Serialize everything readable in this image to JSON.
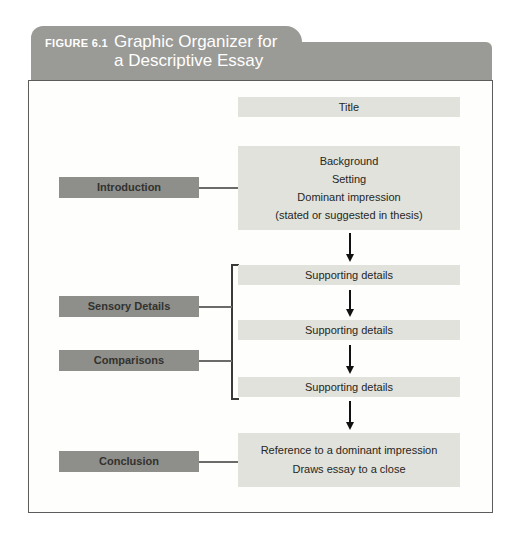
{
  "figure_header": {
    "label": "FIGURE 6.1",
    "title_line1": "Graphic Organizer for",
    "title_line2": "a Descriptive Essay"
  },
  "diagram": {
    "title_box": {
      "text": "Title"
    },
    "introduction": {
      "label": "Introduction",
      "box_lines": [
        "Background",
        "Setting",
        "Dominant impression",
        "(stated or suggested in thesis)"
      ]
    },
    "middle": {
      "label_sensory": "Sensory Details",
      "label_comparisons": "Comparisons",
      "supporting_boxes": [
        "Supporting details",
        "Supporting details",
        "Supporting details"
      ]
    },
    "conclusion": {
      "label": "Conclusion",
      "box_lines": [
        "Reference to a dominant impression",
        "Draws essay to a close"
      ]
    }
  },
  "colors": {
    "header_bg": "#9a9a96",
    "header_text": "#ffffff",
    "label_box_bg": "#8e8e8a",
    "label_box_text": "#32322f",
    "content_box_bg": "#e1e2dc",
    "content_box_text": "#262622",
    "panel_bg": "#fefefd",
    "panel_border": "#5c5c5a",
    "connector": "#6b6b69",
    "bracket": "#3a3a38",
    "arrow": "#111111"
  }
}
